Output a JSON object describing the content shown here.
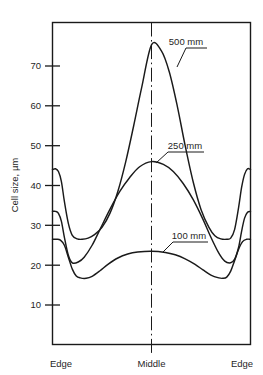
{
  "chart_data": {
    "type": "line",
    "title": "",
    "xlabel": "",
    "ylabel": "Cell size, µm",
    "ylim": [
      0,
      80
    ],
    "yticks": [
      10,
      20,
      30,
      40,
      50,
      60,
      70
    ],
    "ytick_labels": [
      "10",
      "20",
      "30",
      "40",
      "50",
      "60",
      "70"
    ],
    "x_categories": [
      "Edge",
      "Middle",
      "Edge"
    ],
    "x_category_positions": [
      0,
      50,
      100
    ],
    "grid": false,
    "legend_position": "inline-annotations",
    "annotations": [
      {
        "text": "500 mm",
        "series": "500 mm",
        "anchor_x": 78,
        "anchor_y": 69
      },
      {
        "text": "250 mm",
        "series": "250 mm",
        "anchor_x": 55,
        "anchor_y": 45
      },
      {
        "text": "100 mm",
        "series": "100 mm",
        "anchor_x": 58,
        "anchor_y": 22.5
      }
    ],
    "center_reference_line": {
      "x": 50,
      "style": "dash-dot"
    },
    "series": [
      {
        "name": "500 mm",
        "label": "500 mm",
        "color": "#1a1a1a",
        "x": [
          0,
          1.5,
          3,
          4.5,
          6,
          8,
          10,
          12.5,
          15,
          18,
          21,
          25,
          29,
          33,
          37,
          41,
          45,
          50,
          55,
          59,
          63,
          67,
          71,
          75,
          79,
          82,
          85,
          88,
          90,
          92,
          94,
          95.5,
          97,
          98.5,
          100
        ],
        "values": [
          44.0,
          44.2,
          43.5,
          41.0,
          36.0,
          30.5,
          27.5,
          26.6,
          26.5,
          26.8,
          27.6,
          29.5,
          33.0,
          38.5,
          46.0,
          55.0,
          64.5,
          75.3,
          73.8,
          68.5,
          60.0,
          50.0,
          41.0,
          34.0,
          29.5,
          27.4,
          26.6,
          26.5,
          26.8,
          29.0,
          34.5,
          39.5,
          42.8,
          44.2,
          44.0
        ]
      },
      {
        "name": "250 mm",
        "label": "250 mm",
        "color": "#1a1a1a",
        "x": [
          0,
          1.5,
          3,
          4.5,
          6,
          8,
          10,
          13,
          16,
          20,
          24,
          29,
          34,
          39,
          44,
          50,
          56,
          61,
          66,
          71,
          76,
          80,
          84,
          87,
          90,
          92,
          94,
          95.5,
          97,
          98.5,
          100
        ],
        "values": [
          33.5,
          33.5,
          33.0,
          31.0,
          27.0,
          22.5,
          20.6,
          20.8,
          22.0,
          25.0,
          29.0,
          34.0,
          38.5,
          42.0,
          44.7,
          46.0,
          45.3,
          43.5,
          40.5,
          36.5,
          31.5,
          27.0,
          23.0,
          21.0,
          20.6,
          21.5,
          24.5,
          28.5,
          31.8,
          33.3,
          33.5
        ]
      },
      {
        "name": "100 mm",
        "label": "100 mm",
        "color": "#1a1a1a",
        "x": [
          0,
          2,
          4,
          6,
          8,
          10,
          12,
          14,
          17,
          20,
          24,
          28,
          33,
          38,
          43,
          50,
          57,
          62,
          67,
          72,
          76,
          80,
          84,
          86,
          88,
          90,
          92,
          94,
          96,
          98,
          100
        ],
        "values": [
          26.5,
          26.5,
          26.3,
          25.0,
          22.0,
          19.0,
          17.3,
          16.8,
          16.7,
          17.2,
          18.6,
          20.2,
          21.8,
          22.8,
          23.3,
          23.5,
          23.2,
          22.6,
          21.6,
          20.2,
          18.8,
          17.5,
          16.8,
          16.7,
          17.0,
          18.5,
          21.2,
          24.0,
          25.9,
          26.5,
          26.5
        ]
      }
    ]
  },
  "axis": {
    "y_title": "Cell size, µm",
    "x_left_label": "Edge",
    "x_middle_label": "Middle",
    "x_right_label": "Edge"
  },
  "labels": {
    "s500": "500 mm",
    "s250": "250 mm",
    "s100": "100 mm"
  },
  "ticks": {
    "t70": "70",
    "t60": "60",
    "t50": "50",
    "t40": "40",
    "t30": "30",
    "t20": "20",
    "t10": "10"
  },
  "colors": {
    "line": "#1a1a1a",
    "frame": "#1a1a1a",
    "background": "#ffffff"
  }
}
